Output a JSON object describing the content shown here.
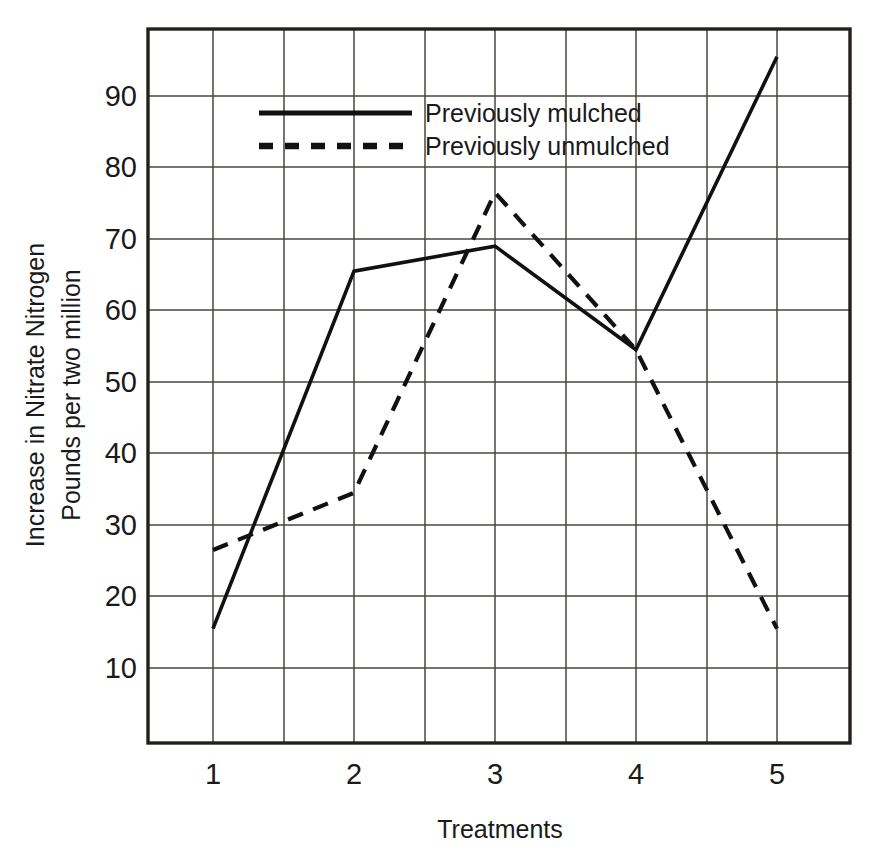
{
  "chart_data": {
    "type": "line",
    "title": "",
    "xlabel": "Treatments",
    "ylabel": "Increase in Nitrate Nitrogen Pounds per two million",
    "ylabel_lines": [
      "Increase in Nitrate Nitrogen",
      "Pounds per two million"
    ],
    "categories": [
      "1",
      "2",
      "3",
      "4",
      "5"
    ],
    "x": [
      1,
      2,
      3,
      4,
      5
    ],
    "xlim": [
      0.5,
      5.5
    ],
    "ylim": [
      0,
      100
    ],
    "yticks": [
      10,
      20,
      30,
      40,
      50,
      60,
      70,
      80,
      90
    ],
    "ytick_labels": [
      "10",
      "20",
      "30",
      "40",
      "50",
      "60",
      "70",
      "80",
      "90"
    ],
    "xticks": [
      1,
      2,
      3,
      4,
      5
    ],
    "xtick_labels": [
      "1",
      "2",
      "3",
      "4",
      "5"
    ],
    "grid": true,
    "grid_x_minor": true,
    "legend_position": "top-center",
    "series": [
      {
        "name": "Previously mulched",
        "style": "solid",
        "values": [
          15.5,
          65.5,
          69,
          54.5,
          95.5
        ]
      },
      {
        "name": "Previously unmulched",
        "style": "dashed",
        "values": [
          26.5,
          34.5,
          76.5,
          54.5,
          15.5
        ]
      }
    ]
  },
  "axes": {
    "y_title_line1": "Increase in Nitrate Nitrogen",
    "y_title_line2": "Pounds per two million",
    "x_title": "Treatments"
  },
  "legend": {
    "entries": [
      {
        "label": "Previously mulched",
        "style": "solid"
      },
      {
        "label": "Previously unmulched",
        "style": "dashed"
      }
    ]
  },
  "colors": {
    "series_line": "#111111",
    "frame": "#231f1c",
    "grid": "#4a443f",
    "background": "#ffffff",
    "text": "#1a1a1a"
  }
}
